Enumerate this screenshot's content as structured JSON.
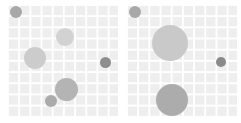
{
  "figure": {
    "width": 241,
    "height": 123,
    "background_color": "#ffffff",
    "panel_count": 2
  },
  "chart_data": {
    "type": "scatter",
    "title": "",
    "subtitle": "",
    "xlabel": "",
    "ylabel": "",
    "legend": [],
    "annotations": [],
    "grid": true,
    "grid_color": "#ffffff",
    "panel_background_color": "#eeeeee",
    "grid_cell_px": 11.2,
    "marker_shape": "circle",
    "xlim": [
      0,
      110
    ],
    "ylim": [
      0,
      112
    ],
    "panels": [
      {
        "name": "left-panel",
        "x": 8,
        "y": 5,
        "width": 110,
        "height": 112,
        "points": [
          {
            "label": "bubble-1",
            "cx": 8,
            "cy": 7,
            "r": 6.0,
            "color": "#a8a8a8"
          },
          {
            "label": "bubble-2",
            "cx": 57,
            "cy": 32,
            "r": 9.0,
            "color": "#d2d2d2"
          },
          {
            "label": "bubble-3",
            "cx": 27,
            "cy": 53,
            "r": 11.0,
            "color": "#cccccc"
          },
          {
            "label": "bubble-4",
            "cx": 97,
            "cy": 57,
            "r": 5.5,
            "color": "#8e8e8e"
          },
          {
            "label": "bubble-5",
            "cx": 58,
            "cy": 84,
            "r": 11.5,
            "color": "#b4b4b4"
          },
          {
            "label": "bubble-6",
            "cx": 43,
            "cy": 96,
            "r": 6.0,
            "color": "#ababab"
          }
        ]
      },
      {
        "name": "right-panel",
        "x": 127,
        "y": 5,
        "width": 110,
        "height": 112,
        "points": [
          {
            "label": "bubble-1",
            "cx": 8,
            "cy": 7,
            "r": 6.0,
            "color": "#a8a8a8"
          },
          {
            "label": "bubble-2",
            "cx": 43,
            "cy": 38,
            "r": 18.0,
            "color": "#c9c9c9"
          },
          {
            "label": "bubble-3",
            "cx": 94,
            "cy": 57,
            "r": 5.0,
            "color": "#8a8a8a"
          },
          {
            "label": "bubble-4",
            "cx": 45,
            "cy": 95,
            "r": 16.0,
            "color": "#acacac"
          }
        ]
      }
    ]
  }
}
